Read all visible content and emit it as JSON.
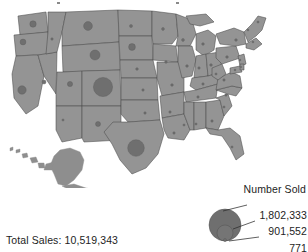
{
  "figure": {
    "type": "proportional_symbol_map",
    "region": "United States",
    "title_fragment": ""
  },
  "legend": {
    "title": "Number Sold",
    "values": [
      "1,802,333",
      "901,552",
      "771"
    ]
  },
  "footer": {
    "total_sales_label": "Total Sales: 10,519,343"
  },
  "colors": {
    "state_fill": "#949494",
    "state_border": "#4c4c4c",
    "symbol_fill": "#6f6f6f",
    "text": "#1d1d1d",
    "background": "#ffffff"
  },
  "chart_data": {
    "type": "scatter",
    "xlabel": "",
    "ylabel": "",
    "legend_position": "bottom-right",
    "grid": false,
    "size_legend": {
      "label": "Number Sold",
      "breaks": [
        1802333,
        901552,
        771
      ],
      "break_labels": [
        "1,802,333",
        "901,552",
        "771"
      ]
    },
    "annotations": [
      "Total Sales: 10,519,343"
    ],
    "total_sales": 10519343,
    "points": [
      {
        "state": "Washington",
        "x": 33,
        "y": 22,
        "r": 3.2,
        "value": 360000
      },
      {
        "state": "Oregon",
        "x": 23,
        "y": 40,
        "r": 2.9,
        "value": 300000
      },
      {
        "state": "California",
        "x": 22,
        "y": 88,
        "r": 4.2,
        "value": 620000
      },
      {
        "state": "Nevada",
        "x": 44,
        "y": 80,
        "r": 2.0,
        "value": 140000
      },
      {
        "state": "Idaho",
        "x": 52,
        "y": 37,
        "r": 1.2,
        "value": 40000
      },
      {
        "state": "Montana",
        "x": 88,
        "y": 24,
        "r": 4.4,
        "value": 690000
      },
      {
        "state": "Wyoming",
        "x": 95,
        "y": 53,
        "r": 5.0,
        "value": 900000
      },
      {
        "state": "Utah",
        "x": 70,
        "y": 82,
        "r": 2.6,
        "value": 230000
      },
      {
        "state": "Colorado",
        "x": 103,
        "y": 85,
        "r": 9.6,
        "value": 1802333
      },
      {
        "state": "Arizona",
        "x": 63,
        "y": 118,
        "r": 1.1,
        "value": 30000
      },
      {
        "state": "New Mexico",
        "x": 98,
        "y": 122,
        "r": 2.5,
        "value": 210000
      },
      {
        "state": "North Dakota",
        "x": 131,
        "y": 24,
        "r": 1.5,
        "value": 60000
      },
      {
        "state": "South Dakota",
        "x": 132,
        "y": 45,
        "r": 3.4,
        "value": 400000
      },
      {
        "state": "Nebraska",
        "x": 137,
        "y": 67,
        "r": 1.3,
        "value": 45000
      },
      {
        "state": "Kansas",
        "x": 143,
        "y": 88,
        "r": 1.2,
        "value": 40000
      },
      {
        "state": "Oklahoma",
        "x": 145,
        "y": 111,
        "r": 1.2,
        "value": 40000
      },
      {
        "state": "Texas",
        "x": 136,
        "y": 146,
        "r": 8.3,
        "value": 1450000
      },
      {
        "state": "Minnesota",
        "x": 163,
        "y": 27,
        "r": 1.4,
        "value": 50000
      },
      {
        "state": "Iowa",
        "x": 166,
        "y": 60,
        "r": 1.3,
        "value": 45000
      },
      {
        "state": "Missouri",
        "x": 172,
        "y": 83,
        "r": 1.3,
        "value": 45000
      },
      {
        "state": "Arkansas",
        "x": 170,
        "y": 110,
        "r": 1.2,
        "value": 40000
      },
      {
        "state": "Louisiana",
        "x": 174,
        "y": 131,
        "r": 1.2,
        "value": 40000
      },
      {
        "state": "Wisconsin",
        "x": 183,
        "y": 38,
        "r": 1.4,
        "value": 50000
      },
      {
        "state": "Illinois",
        "x": 187,
        "y": 64,
        "r": 1.3,
        "value": 45000
      },
      {
        "state": "Michigan",
        "x": 203,
        "y": 42,
        "r": 1.3,
        "value": 45000
      },
      {
        "state": "Indiana",
        "x": 199,
        "y": 66,
        "r": 1.2,
        "value": 40000
      },
      {
        "state": "Ohio",
        "x": 211,
        "y": 63,
        "r": 1.3,
        "value": 45000
      },
      {
        "state": "Kentucky",
        "x": 203,
        "y": 82,
        "r": 1.2,
        "value": 40000
      },
      {
        "state": "Tennessee",
        "x": 198,
        "y": 95,
        "r": 1.2,
        "value": 40000
      },
      {
        "state": "Mississippi",
        "x": 184,
        "y": 123,
        "r": 1.1,
        "value": 30000
      },
      {
        "state": "Alabama",
        "x": 196,
        "y": 122,
        "r": 1.1,
        "value": 30000
      },
      {
        "state": "Georgia",
        "x": 212,
        "y": 119,
        "r": 1.2,
        "value": 40000
      },
      {
        "state": "Florida",
        "x": 232,
        "y": 145,
        "r": 1.1,
        "value": 30000
      },
      {
        "state": "South Carolina",
        "x": 224,
        "y": 105,
        "r": 1.1,
        "value": 30000
      },
      {
        "state": "North Carolina",
        "x": 226,
        "y": 93,
        "r": 1.2,
        "value": 40000
      },
      {
        "state": "Virginia",
        "x": 224,
        "y": 78,
        "r": 1.2,
        "value": 40000
      },
      {
        "state": "West Virginia",
        "x": 216,
        "y": 72,
        "r": 1.1,
        "value": 30000
      },
      {
        "state": "Pennsylvania",
        "x": 227,
        "y": 55,
        "r": 1.3,
        "value": 45000
      },
      {
        "state": "New York",
        "x": 236,
        "y": 38,
        "r": 1.3,
        "value": 45000
      },
      {
        "state": "Maine",
        "x": 258,
        "y": 20,
        "r": 1.1,
        "value": 30000
      },
      {
        "state": "Vermont",
        "x": 248,
        "y": 28,
        "r": 0.9,
        "value": 20000
      },
      {
        "state": "Massachusetts",
        "x": 253,
        "y": 40,
        "r": 0.9,
        "value": 20000
      },
      {
        "state": "New Jersey",
        "x": 240,
        "y": 58,
        "r": 0.9,
        "value": 20000
      },
      {
        "state": "Maryland",
        "x": 235,
        "y": 68,
        "r": 0.9,
        "value": 20000
      },
      {
        "state": "Delaware",
        "x": 241,
        "y": 65,
        "r": 0.8,
        "value": 771
      }
    ]
  }
}
